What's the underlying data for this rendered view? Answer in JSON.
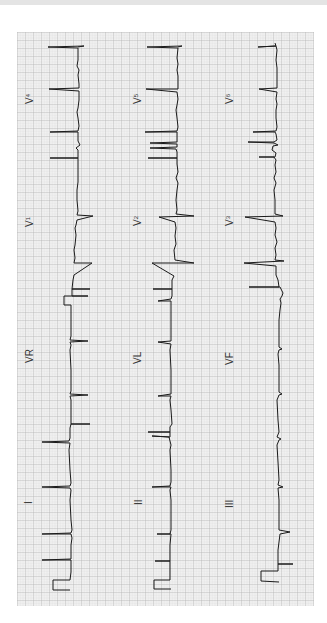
{
  "figure": {
    "type": "12-lead electrocardiogram",
    "orientation": "rotated 90 degrees counterclockwise",
    "colors": {
      "paper": "#f4f4f4",
      "grid_minor": "#d8d8d8",
      "grid_major": "#a8a8a8",
      "trace": "#1a1a1a",
      "top_band": "#e4e4e4"
    }
  },
  "leads": {
    "row1": [
      {
        "name": "I",
        "label": "I",
        "sub": ""
      },
      {
        "name": "VR",
        "label": "VR",
        "sub": ""
      },
      {
        "name": "V1",
        "label": "V",
        "sub": "1"
      },
      {
        "name": "V4",
        "label": "V",
        "sub": "4"
      }
    ],
    "row2": [
      {
        "name": "II",
        "label": "II",
        "sub": ""
      },
      {
        "name": "VL",
        "label": "VL",
        "sub": ""
      },
      {
        "name": "V2",
        "label": "V",
        "sub": "2"
      },
      {
        "name": "V5",
        "label": "V",
        "sub": "5"
      }
    ],
    "row3": [
      {
        "name": "III",
        "label": "III",
        "sub": ""
      },
      {
        "name": "VF",
        "label": "VF",
        "sub": ""
      },
      {
        "name": "V3",
        "label": "V",
        "sub": "3"
      },
      {
        "name": "V6",
        "label": "V",
        "sub": "6"
      }
    ]
  }
}
